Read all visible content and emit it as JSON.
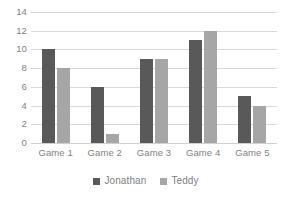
{
  "chart_data": {
    "type": "bar",
    "title": "",
    "xlabel": "",
    "ylabel": "",
    "categories": [
      "Game 1",
      "Game 2",
      "Game 3",
      "Game 4",
      "Game 5"
    ],
    "series": [
      {
        "name": "Jonathan",
        "color": "#595959",
        "values": [
          10,
          6,
          9,
          11,
          5
        ]
      },
      {
        "name": "Teddy",
        "color": "#a6a6a6",
        "values": [
          8,
          1,
          9,
          12,
          4
        ]
      }
    ],
    "ylim": [
      0,
      14
    ],
    "ytick_step": 2,
    "yticks": [
      14,
      12,
      10,
      8,
      6,
      4,
      2,
      0
    ],
    "grid": true,
    "grid_axis": "y",
    "legend_position": "bottom",
    "annotations": []
  }
}
